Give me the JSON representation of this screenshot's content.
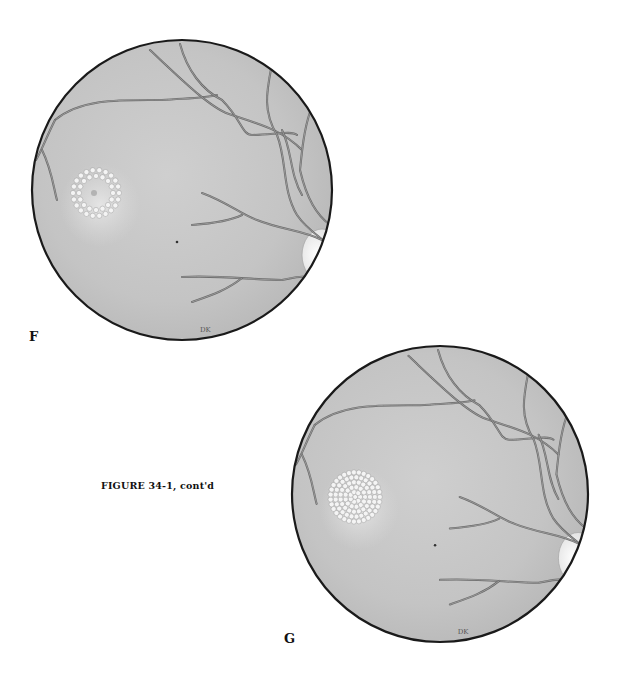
{
  "figure": {
    "caption": "FIGURE 34-1, cont'd",
    "panels": [
      {
        "id": "F",
        "label": "F",
        "subject": "fundus illustration",
        "laser_pattern": "ring",
        "signature": "DK"
      },
      {
        "id": "G",
        "label": "G",
        "subject": "fundus illustration",
        "laser_pattern": "filled-disc",
        "signature": "DK"
      }
    ]
  },
  "colors": {
    "background": "#ffffff",
    "fundus_fill": "#c9c9c9",
    "fundus_border": "#1a1a1a",
    "vessel": "#6a6a6a",
    "laser_spot": "#f4f4f4",
    "optic_disc": "#f2f2f2",
    "text": "#111111"
  }
}
